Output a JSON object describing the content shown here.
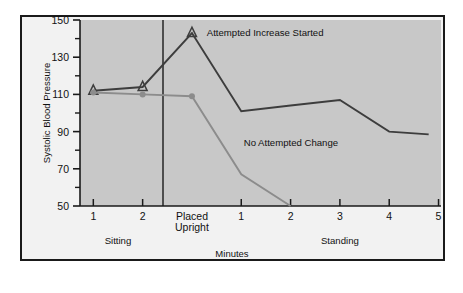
{
  "chart_data": {
    "type": "line",
    "title": "",
    "xlabel": "Minutes",
    "ylabel": "Systolic Blood Pressure",
    "ylim": [
      50,
      150
    ],
    "yticks": [
      50,
      70,
      90,
      110,
      130,
      150
    ],
    "ytick_labels": [
      "50",
      "70",
      "90",
      "110",
      "130",
      "150"
    ],
    "minor_yticks": [
      60,
      80,
      100,
      120,
      140
    ],
    "grid": false,
    "legend_position": "inline-annotations",
    "x_positions": [
      0,
      1,
      2,
      3,
      4,
      5,
      6,
      7
    ],
    "xtick_labels": [
      "1",
      "2",
      "Placed Upright",
      "1",
      "2",
      "3",
      "4",
      "5"
    ],
    "x_group_labels": [
      {
        "label": "Sitting",
        "x_center": 0.5
      },
      {
        "label": "Standing",
        "x_center": 5.0
      }
    ],
    "vertical_marker_x": 2,
    "series": [
      {
        "name": "Attempted Increase Started",
        "color": "#3d3d3d",
        "marker": "triangle",
        "x": [
          0,
          1,
          2,
          3,
          4,
          5,
          6,
          6.8
        ],
        "values": [
          112,
          114,
          143,
          101,
          104,
          107,
          90,
          88.5
        ]
      },
      {
        "name": "No Attempted Change",
        "color": "#8c8c8c",
        "marker": "circle",
        "x": [
          0,
          1,
          2,
          3,
          4
        ],
        "values": [
          111,
          110,
          109,
          67,
          50
        ]
      }
    ],
    "annotations": [
      {
        "text": "Attempted Increase Started",
        "x": 2.3,
        "y": 143
      },
      {
        "text": "No Attempted Change",
        "x": 3.05,
        "y": 84
      }
    ]
  },
  "colors": {
    "plot_background": "#c8c8c8",
    "figure_background": "#f2f2f2",
    "frame": "#1a1a1a",
    "axis": "#1a1a1a",
    "series_dark": "#3d3d3d",
    "series_light": "#8c8c8c"
  }
}
